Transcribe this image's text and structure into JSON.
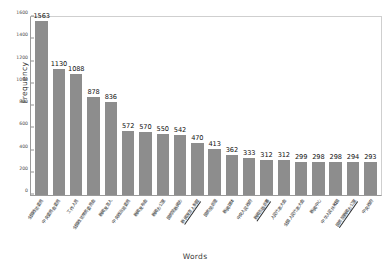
{
  "chart_data": {
    "type": "bar",
    "title": "",
    "xlabel": "Words",
    "ylabel": "Frequency",
    "ylim": [
      0,
      1600
    ],
    "yticks": [
      0,
      200,
      400,
      600,
      800,
      1000,
      1200,
      1400,
      1600
    ],
    "grid": false,
    "legend": null,
    "bar_color": "#8d8d8d",
    "categories": [
      "全国政协委员",
      "中央委员会委员",
      "工作人员",
      "全国政协常务委员会",
      "新闻发言人",
      "中央政治局委员",
      "新闻发布会",
      "新闻办公室",
      "国务院新闻办",
      "新闻发言人制度",
      "国务院总理",
      "新闻媒体",
      "中央人民政府",
      "新闻出版总署",
      "人民代表大会",
      "全国人民代表大会",
      "新闻中心",
      "中华人民共和国",
      "国务院新闻办公室",
      "中央政府"
    ],
    "categories_underlined": [
      false,
      false,
      false,
      false,
      false,
      false,
      false,
      false,
      false,
      true,
      false,
      false,
      false,
      true,
      false,
      false,
      false,
      false,
      true,
      false
    ],
    "values": [
      1563,
      1130,
      1088,
      878,
      836,
      572,
      570,
      550,
      542,
      470,
      413,
      362,
      333,
      312,
      312,
      299,
      298,
      298,
      294,
      293
    ]
  }
}
